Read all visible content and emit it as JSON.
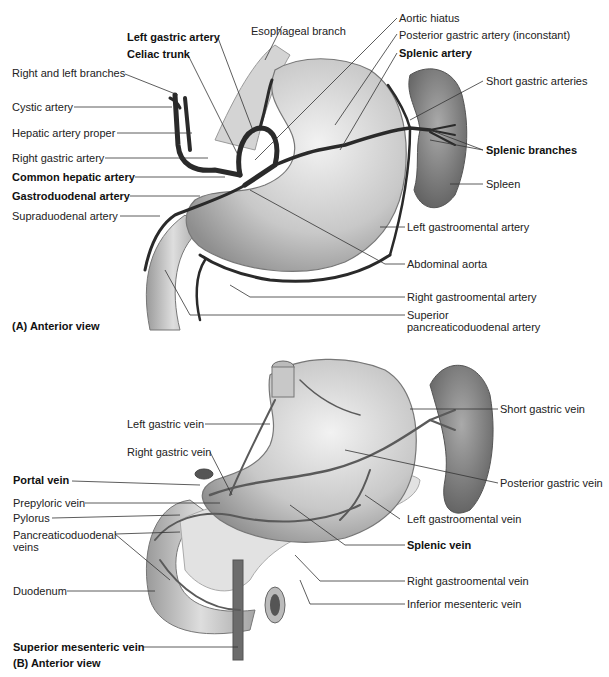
{
  "panel_a": {
    "caption": "(A)  Anterior view",
    "labels": {
      "left_gastric_artery": "Left gastric artery",
      "celiac_trunk": "Celiac trunk",
      "esophageal_branch": "Esophageal branch",
      "aortic_hiatus": "Aortic hiatus",
      "posterior_gastric_artery": "Posterior gastric artery (inconstant)",
      "splenic_artery": "Splenic artery",
      "right_left_branches": "Right and left branches",
      "cystic_artery": "Cystic artery",
      "hepatic_artery_proper": "Hepatic artery proper",
      "right_gastric_artery": "Right gastric artery",
      "common_hepatic_artery": "Common hepatic artery",
      "gastroduodenal_artery": "Gastroduodenal artery",
      "supraduodenal_artery": "Supraduodenal artery",
      "short_gastric_arteries": "Short gastric arteries",
      "splenic_branches": "Splenic branches",
      "spleen": "Spleen",
      "left_gastroomental_artery": "Left gastroomental artery",
      "abdominal_aorta": "Abdominal aorta",
      "right_gastroomental_artery": "Right gastroomental artery",
      "superior_pancreaticoduodenal_1": "Superior",
      "superior_pancreaticoduodenal_2": "pancreaticoduodenal artery"
    }
  },
  "panel_b": {
    "caption": "(B)  Anterior view",
    "labels": {
      "left_gastric_vein": "Left gastric vein",
      "right_gastric_vein": "Right gastric vein",
      "portal_vein": "Portal vein",
      "prepyloric_vein": "Prepyloric vein",
      "pylorus": "Pylorus",
      "pancreaticoduodenal_veins_1": "Pancreaticoduodenal",
      "pancreaticoduodenal_veins_2": "veins",
      "duodenum": "Duodenum",
      "superior_mesenteric_vein": "Superior mesenteric vein",
      "short_gastric_vein": "Short gastric vein",
      "posterior_gastric_vein": "Posterior gastric vein",
      "left_gastroomental_vein": "Left gastroomental vein",
      "splenic_vein": "Splenic vein",
      "right_gastroomental_vein": "Right gastroomental vein",
      "inferior_mesenteric_vein": "Inferior mesenteric vein"
    }
  },
  "colors": {
    "organ_fill": "#c9c9c9",
    "spleen_fill": "#8a8a8a",
    "vessel": "#2a2a2a",
    "vein": "#6a6a6a",
    "leader": "#333333"
  }
}
